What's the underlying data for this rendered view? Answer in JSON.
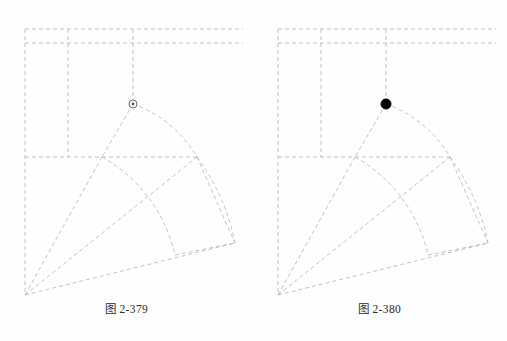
{
  "page": {
    "background_color": "#fefefe",
    "width": 507,
    "height": 341,
    "kind": "textbook-illustration-pair"
  },
  "style": {
    "construction_line_color": "#b5b5b5",
    "construction_line_color_dark": "#9d9d9d",
    "marker_fill_color": "#000000",
    "marker_stroke_color": "#555555",
    "caption_color": "#2b2b2b",
    "dash_pattern": "4,3",
    "line_width": 0.8
  },
  "figures": [
    {
      "id": "fig-2-379",
      "caption": "图 2-379",
      "marker": {
        "name": "snap-node-marker",
        "style": "hollow",
        "x": 133,
        "y": 104,
        "radius": 4
      },
      "geometry": {
        "apex": {
          "x": 25,
          "y": 295
        },
        "grid": {
          "horizontal_lines": [
            {
              "y": 29,
              "x1": 25,
              "x2": 243
            },
            {
              "y": 43,
              "x1": 25,
              "x2": 243
            },
            {
              "y": 157,
              "x1": 25,
              "x2": 200
            }
          ],
          "vertical_lines": [
            {
              "x": 25,
              "y1": 29,
              "y2": 295
            },
            {
              "x": 68,
              "y1": 29,
              "y2": 157
            },
            {
              "x": 133,
              "y1": 29,
              "y2": 104
            }
          ]
        },
        "radial_lines": [
          {
            "x1": 25,
            "y1": 295,
            "x2": 102,
            "y2": 157
          },
          {
            "x1": 25,
            "y1": 295,
            "x2": 197,
            "y2": 157
          },
          {
            "x1": 25,
            "y1": 295,
            "x2": 235,
            "y2": 243
          }
        ],
        "chords": [
          {
            "x1": 133,
            "y1": 104,
            "x2": 102,
            "y2": 157
          },
          {
            "x1": 197,
            "y1": 157,
            "x2": 235,
            "y2": 243
          },
          {
            "x1": 175,
            "y1": 255,
            "x2": 235,
            "y2": 243
          }
        ],
        "arcs": [
          {
            "name": "inner-arc-upper",
            "x1": 133,
            "y1": 104,
            "x2": 197,
            "y2": 157,
            "rx": 120,
            "ry": 120,
            "sweep": 1
          },
          {
            "name": "inner-arc-lower",
            "x1": 102,
            "y1": 157,
            "x2": 175,
            "y2": 255,
            "rx": 150,
            "ry": 150,
            "sweep": 1
          },
          {
            "name": "outer-arc",
            "x1": 197,
            "y1": 157,
            "x2": 235,
            "y2": 243,
            "rx": 215,
            "ry": 215,
            "sweep": 1
          }
        ]
      }
    },
    {
      "id": "fig-2-380",
      "caption": "图 2-380",
      "marker": {
        "name": "selected-point-marker",
        "style": "filled",
        "x": 133,
        "y": 104,
        "radius": 5
      },
      "geometry": {
        "apex": {
          "x": 25,
          "y": 295
        },
        "grid": {
          "horizontal_lines": [
            {
              "y": 29,
              "x1": 25,
              "x2": 243
            },
            {
              "y": 43,
              "x1": 25,
              "x2": 243
            },
            {
              "y": 157,
              "x1": 25,
              "x2": 200
            }
          ],
          "vertical_lines": [
            {
              "x": 25,
              "y1": 29,
              "y2": 295
            },
            {
              "x": 68,
              "y1": 29,
              "y2": 157
            },
            {
              "x": 133,
              "y1": 29,
              "y2": 104
            }
          ]
        },
        "radial_lines": [
          {
            "x1": 25,
            "y1": 295,
            "x2": 102,
            "y2": 157
          },
          {
            "x1": 25,
            "y1": 295,
            "x2": 197,
            "y2": 157
          },
          {
            "x1": 25,
            "y1": 295,
            "x2": 235,
            "y2": 243
          }
        ],
        "chords": [
          {
            "x1": 133,
            "y1": 104,
            "x2": 102,
            "y2": 157
          },
          {
            "x1": 197,
            "y1": 157,
            "x2": 235,
            "y2": 243
          },
          {
            "x1": 175,
            "y1": 255,
            "x2": 235,
            "y2": 243
          }
        ],
        "arcs": [
          {
            "name": "inner-arc-upper",
            "x1": 133,
            "y1": 104,
            "x2": 197,
            "y2": 157,
            "rx": 120,
            "ry": 120,
            "sweep": 1
          },
          {
            "name": "inner-arc-lower",
            "x1": 102,
            "y1": 157,
            "x2": 175,
            "y2": 255,
            "rx": 150,
            "ry": 150,
            "sweep": 1
          },
          {
            "name": "outer-arc",
            "x1": 197,
            "y1": 157,
            "x2": 235,
            "y2": 243,
            "rx": 215,
            "ry": 215,
            "sweep": 1
          }
        ]
      }
    }
  ]
}
